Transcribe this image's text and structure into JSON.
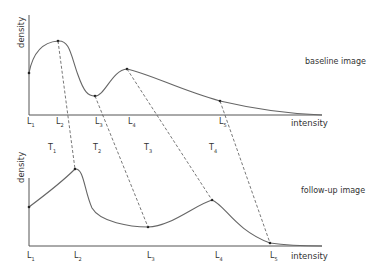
{
  "top_panel": {
    "title": "baseline image",
    "x_axis_label": "intensity",
    "y_axis_label": "density",
    "levels": [
      {
        "name": "L",
        "sub": "1"
      },
      {
        "name": "L",
        "sub": "2"
      },
      {
        "name": "L",
        "sub": "3"
      },
      {
        "name": "L",
        "sub": "4"
      },
      {
        "name": "L",
        "sub": "5"
      }
    ]
  },
  "transforms": [
    {
      "name": "T",
      "sub": "1"
    },
    {
      "name": "T",
      "sub": "2"
    },
    {
      "name": "T",
      "sub": "3"
    },
    {
      "name": "T",
      "sub": "4"
    }
  ],
  "bottom_panel": {
    "title": "follow-up image",
    "x_axis_label": "intensity",
    "y_axis_label": "density",
    "levels": [
      {
        "name": "L",
        "sub": "1"
      },
      {
        "name": "L",
        "sub": "2"
      },
      {
        "name": "L",
        "sub": "3"
      },
      {
        "name": "L",
        "sub": "4"
      },
      {
        "name": "L",
        "sub": "5"
      }
    ]
  }
}
